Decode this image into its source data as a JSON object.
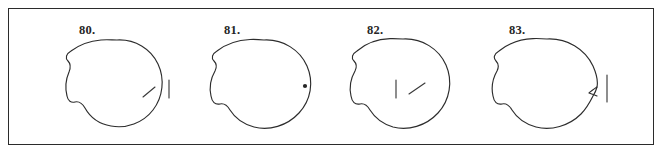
{
  "plate": {
    "background_color": "#ffffff",
    "border_color": "#2b2b2b",
    "ink_color": "#2d2d2d",
    "label_color": "#262626",
    "panel_count": 4
  },
  "panels": [
    {
      "label": "80.",
      "shape_name": "closed-irregular-circle-outline",
      "marks": [
        {
          "type": "diagonal-tick",
          "name": "interior-diagonal-tick"
        },
        {
          "type": "vertical-tick",
          "name": "exterior-vertical-tick"
        }
      ]
    },
    {
      "label": "81.",
      "shape_name": "closed-irregular-circle-outline",
      "marks": [
        {
          "type": "dot",
          "name": "interior-dot"
        }
      ]
    },
    {
      "label": "82.",
      "shape_name": "closed-irregular-circle-outline",
      "marks": [
        {
          "type": "vertical-tick",
          "name": "interior-vertical-tick"
        },
        {
          "type": "diagonal-tick",
          "name": "interior-diagonal-tick"
        }
      ]
    },
    {
      "label": "83.",
      "shape_name": "closed-irregular-circle-outline-with-cusp",
      "marks": [
        {
          "type": "cusp",
          "name": "right-edge-inward-cusp"
        },
        {
          "type": "vertical-tick",
          "name": "exterior-vertical-tick"
        }
      ]
    }
  ]
}
